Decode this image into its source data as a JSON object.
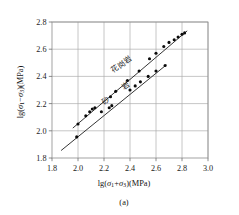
{
  "figure": {
    "caption": "(a)",
    "background": "#ffffff",
    "line_color": "#111111",
    "point_color": "#0b0b0b",
    "grid_color": "#a8a8a8"
  },
  "chart_data": {
    "type": "scatter",
    "title": "",
    "subtitle": "",
    "caption": "(a)",
    "xlabel": "lg(σ₁+σ₃)(MPa)",
    "ylabel": "lg(σ₁−σ₃)(MPa)",
    "xlim": [
      1.8,
      3.0
    ],
    "ylim": [
      1.8,
      2.8
    ],
    "xticks": [
      "1.8",
      "2.0",
      "2.2",
      "2.4",
      "2.6",
      "2.8",
      "3.0"
    ],
    "xtick_values": [
      1.8,
      2.0,
      2.2,
      2.4,
      2.6,
      2.8,
      3.0
    ],
    "yticks": [
      "1.8",
      "2.0",
      "2.2",
      "2.4",
      "2.6",
      "2.8"
    ],
    "ytick_values": [
      1.8,
      2.0,
      2.2,
      2.4,
      2.6,
      2.8
    ],
    "grid": true,
    "legend_position": "inline-annotation",
    "series": [
      {
        "name": "花岗岩",
        "label_rotation_deg": -36,
        "marker": "filled-circle",
        "x": [
          2.0,
          2.06,
          2.09,
          2.11,
          2.13,
          2.25,
          2.29,
          2.38,
          2.47,
          2.55,
          2.6,
          2.66,
          2.7,
          2.74,
          2.77,
          2.8,
          2.82
        ],
        "y": [
          2.05,
          2.11,
          2.14,
          2.16,
          2.17,
          2.25,
          2.29,
          2.37,
          2.44,
          2.53,
          2.57,
          2.62,
          2.65,
          2.67,
          2.69,
          2.71,
          2.72
        ],
        "fit_line": {
          "x0": 1.96,
          "y0": 2.02,
          "x1": 2.84,
          "y1": 2.735
        }
      },
      {
        "name": "砂岩",
        "label_chars": [
          "砂",
          "岩"
        ],
        "label_rotation_deg": -36,
        "marker": "filled-circle",
        "x": [
          1.99,
          2.18,
          2.24,
          2.26,
          2.4,
          2.44,
          2.48,
          2.54,
          2.6,
          2.67
        ],
        "y": [
          1.955,
          2.14,
          2.17,
          2.185,
          2.3,
          2.33,
          2.36,
          2.4,
          2.44,
          2.48
        ],
        "fit_line": {
          "x0": 1.87,
          "y0": 1.855,
          "x1": 2.68,
          "y1": 2.485
        }
      }
    ]
  },
  "annotations": [
    {
      "name": "granite-label",
      "text": "花岗岩"
    },
    {
      "name": "sandstone-label-1",
      "text": "砂"
    },
    {
      "name": "sandstone-label-2",
      "text": "岩"
    }
  ],
  "axis_text": {
    "x_prefix": "lg(",
    "x_sigma1": "σ",
    "x_sub1": "1",
    "x_op": "+",
    "x_sigma3": "σ",
    "x_sub3": "3",
    "x_suffix": ")(MPa)",
    "y_prefix": "lg(",
    "y_sigma1": "σ",
    "y_sub1": "1",
    "y_op": "−",
    "y_sigma3": "σ",
    "y_sub3": "3",
    "y_suffix": ")(MPa)"
  }
}
